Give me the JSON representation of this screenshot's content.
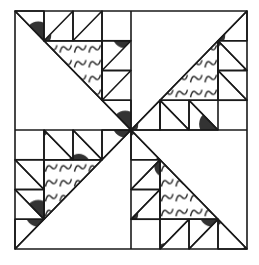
{
  "diagram": {
    "grid_units": 8,
    "colors": {
      "line": "#1a1a1a",
      "background": "#ffffff",
      "dots": "#333333"
    },
    "quadrants": [
      {
        "name": "top-left",
        "diagonal": "top-left to center"
      },
      {
        "name": "top-right",
        "diagonal": "center to top-right"
      },
      {
        "name": "bottom-left",
        "diagonal": "bottom-left to center"
      },
      {
        "name": "bottom-right",
        "diagonal": "center to bottom-right"
      }
    ],
    "fills": [
      "dotted",
      "scalloped",
      "plain"
    ]
  }
}
